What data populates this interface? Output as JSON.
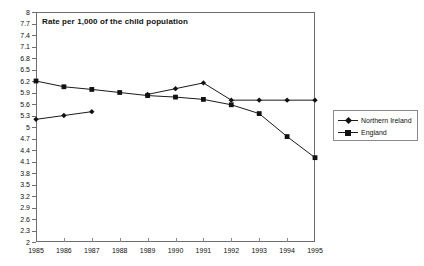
{
  "chart_data": {
    "type": "line",
    "title": "Rate per 1,000 of the child population",
    "xlabel": "",
    "ylabel": "",
    "categories": [
      "1985",
      "1986",
      "1987",
      "1988",
      "1989",
      "1990",
      "1991",
      "1992",
      "1993",
      "1994",
      "1995"
    ],
    "x": [
      1985,
      1986,
      1987,
      1988,
      1989,
      1990,
      1991,
      1992,
      1993,
      1994,
      1995
    ],
    "ylim": [
      2,
      8
    ],
    "xlim": [
      1985,
      1995
    ],
    "ytick_step": 0.3,
    "yticks": [
      8,
      7.7,
      7.4,
      7.1,
      6.8,
      6.5,
      6.2,
      5.9,
      5.6,
      5.3,
      5,
      4.7,
      4.4,
      4.1,
      3.8,
      3.5,
      3.2,
      2.9,
      2.6,
      2.3,
      2
    ],
    "ytick_labels": [
      "8",
      "7.7",
      "7.4",
      "7.1",
      "6.8",
      "6.5",
      "6.2",
      "5.9",
      "5.6",
      "5.3",
      "5",
      "4.7",
      "4.4",
      "4.1",
      "3.8",
      "3.5",
      "3.2",
      "2.9",
      "2.6",
      "2.3",
      "2"
    ],
    "grid": false,
    "legend_position": "right",
    "series": [
      {
        "name": "Northern Ireland",
        "marker": "diamond",
        "color": "#111111",
        "values": [
          5.2,
          5.3,
          5.4,
          null,
          5.85,
          6.0,
          6.15,
          5.7,
          5.7,
          5.7,
          5.7
        ]
      },
      {
        "name": "England",
        "marker": "square",
        "color": "#111111",
        "values": [
          6.2,
          6.05,
          5.98,
          5.9,
          5.82,
          5.78,
          5.72,
          5.58,
          5.35,
          4.75,
          4.2
        ]
      }
    ]
  },
  "legend": {
    "items": [
      {
        "label": "Northern Ireland",
        "marker": "diamond"
      },
      {
        "label": "England",
        "marker": "square"
      }
    ]
  }
}
